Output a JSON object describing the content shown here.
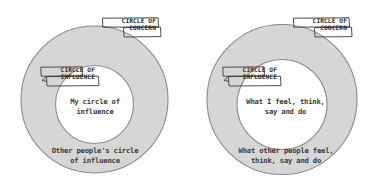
{
  "page": {
    "background_color": "#fdfdfd"
  },
  "style": {
    "ring_fill": "#d6d6d6",
    "inner_fill": "#fefefe",
    "stroke_color": "#8a8a8a",
    "text_color": "#3b3b3b",
    "tag_text_color": "#2f2f2f",
    "tag_stroke_color": "#3a3a3a"
  },
  "diagrams": [
    {
      "id": "left",
      "name": "circle-of-influence-generic",
      "tag_concern": {
        "line1": "CIRCLE OF",
        "line2": "CONCERN"
      },
      "tag_influence": {
        "line1": "CIRCLE OF",
        "line2": "INFLUENCE"
      },
      "inner_label": "My circle of\ninfluence",
      "outer_label": "Other people's circle\nof influence"
    },
    {
      "id": "right",
      "name": "circle-of-influence-detailed",
      "tag_concern": {
        "line1": "CIRCLE OF",
        "line2": "CONCERN"
      },
      "tag_influence": {
        "line1": "CIRCLE OF",
        "line2": "INFLUENCE"
      },
      "inner_label": "What I feel, think,\nsay and do",
      "outer_label": "What other people feel,\nthink, say and do"
    }
  ]
}
